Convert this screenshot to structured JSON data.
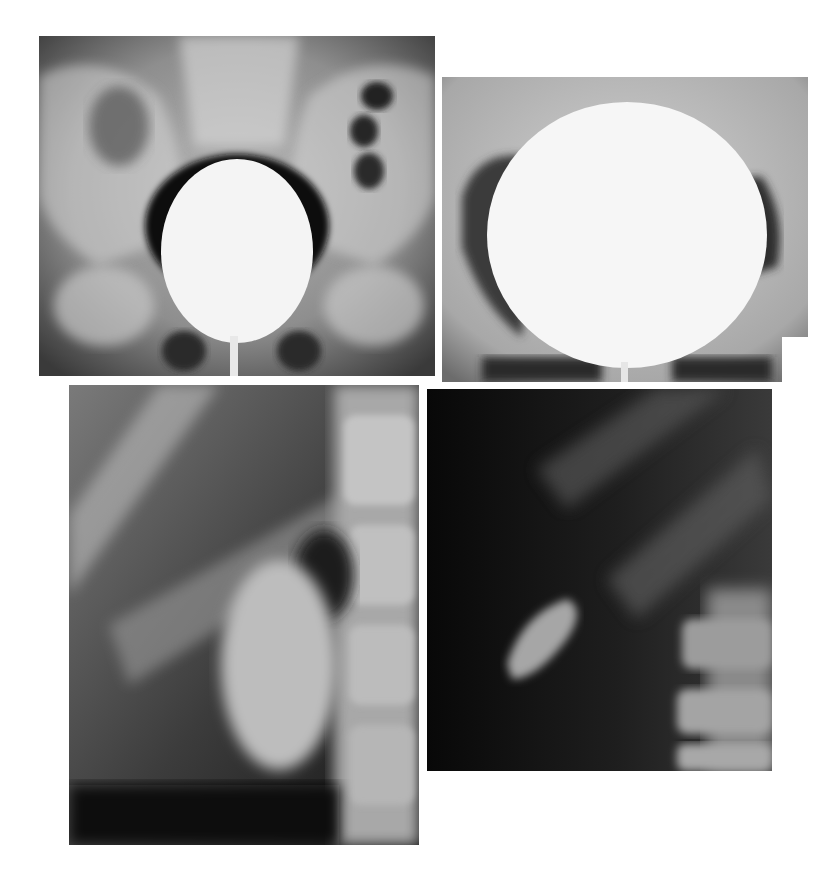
{
  "page": {
    "background": "#ffffff",
    "figures": [
      {
        "id": "panel-a",
        "subject": "pelvic radiograph with contrast-filled bladder (oval)",
        "tone": "grayscale"
      },
      {
        "id": "panel-b",
        "subject": "pelvic radiograph with markedly distended contrast-filled bladder (round)",
        "tone": "grayscale"
      },
      {
        "id": "panel-c",
        "subject": "renal radiograph with opacified kidney beside lumbar spine",
        "tone": "grayscale"
      },
      {
        "id": "panel-d",
        "subject": "dark renal radiograph with small opacified lower pole beside lumbar spine",
        "tone": "grayscale"
      }
    ]
  }
}
